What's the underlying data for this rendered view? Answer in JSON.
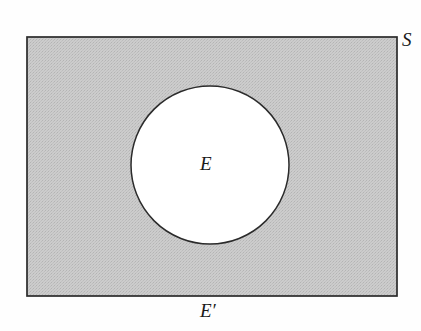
{
  "figure": {
    "kind": "venn-diagram",
    "canvas": {
      "width": 421,
      "height": 331,
      "background": "#fefefe"
    },
    "universal_set": {
      "shape": "rectangle",
      "label": "S",
      "x": 27,
      "y": 37,
      "width": 370,
      "height": 259,
      "fill": "#c9c9c9",
      "stroke": "#2b2b2b",
      "stroke_width": 1.6,
      "shading": "halftone-gray"
    },
    "set": {
      "shape": "circle",
      "label": "E",
      "cx": 210,
      "cy": 165,
      "r": 79,
      "fill": "#ffffff",
      "stroke": "#2b2b2b",
      "stroke_width": 1.4
    },
    "complement": {
      "label": "E′",
      "region": "rectangle-minus-circle",
      "fill": "#c9c9c9"
    },
    "labels": {
      "universe": "S",
      "set": "E",
      "complement": "E′"
    },
    "colors": {
      "shaded": "#c9c9c9",
      "unshaded": "#ffffff",
      "outline": "#2b2b2b",
      "text": "#1a1a1a",
      "background": "#fefefe"
    }
  }
}
